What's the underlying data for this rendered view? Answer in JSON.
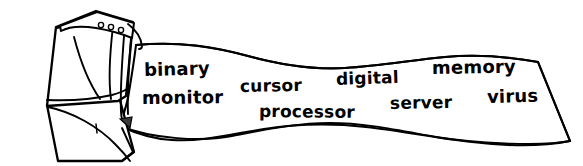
{
  "illustration": {
    "title": "Printer with printed word banner",
    "style": "black and white line drawing",
    "ink_color": "#000000",
    "background_color": "#ffffff",
    "device": {
      "name": "printer",
      "indicator_lights_count": 3,
      "paper_slot_label": "paper output slot"
    },
    "banner": {
      "name": "printed paper strip",
      "words": [
        {
          "id": "binary",
          "text": "binary"
        },
        {
          "id": "monitor",
          "text": "monitor"
        },
        {
          "id": "cursor",
          "text": "cursor"
        },
        {
          "id": "processor",
          "text": "processor"
        },
        {
          "id": "digital",
          "text": "digital"
        },
        {
          "id": "memory",
          "text": "memory"
        },
        {
          "id": "server",
          "text": "server"
        },
        {
          "id": "virus",
          "text": "virus"
        }
      ]
    }
  }
}
